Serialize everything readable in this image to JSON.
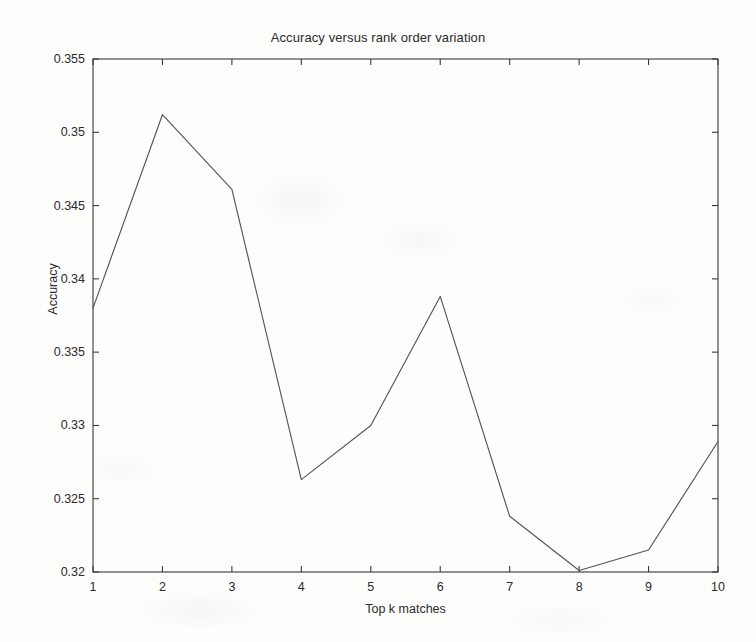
{
  "figure": {
    "background_color": "#fdfdfc",
    "axis_color": "#3a3a3a",
    "line_color": "#555555",
    "text_color": "#2b2b2b"
  },
  "chart_data": {
    "type": "line",
    "title": "Accuracy versus rank order variation",
    "xlabel": "Top k matches",
    "ylabel": "Accuracy",
    "x": [
      1,
      2,
      3,
      4,
      5,
      6,
      7,
      8,
      9,
      10
    ],
    "values": [
      0.338,
      0.3512,
      0.3461,
      0.3263,
      0.33,
      0.3388,
      0.3238,
      0.3201,
      0.3215,
      0.3289
    ],
    "xlim": [
      1,
      10
    ],
    "ylim": [
      0.32,
      0.355
    ],
    "xticks": [
      1,
      2,
      3,
      4,
      5,
      6,
      7,
      8,
      9,
      10
    ],
    "xtick_labels": [
      "1",
      "2",
      "3",
      "4",
      "5",
      "6",
      "7",
      "8",
      "9",
      "10"
    ],
    "yticks": [
      0.32,
      0.325,
      0.33,
      0.335,
      0.34,
      0.345,
      0.35,
      0.355
    ],
    "ytick_labels": [
      "0.32",
      "0.325",
      "0.33",
      "0.335",
      "0.34",
      "0.345",
      "0.35",
      "0.355"
    ],
    "grid": false,
    "legend": null,
    "markers": false,
    "series_name": "Accuracy"
  },
  "plot_box": {
    "left": 93,
    "top": 59,
    "right": 718,
    "bottom": 572
  }
}
